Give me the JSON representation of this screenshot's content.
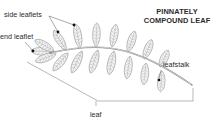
{
  "title": {
    "line1": "PINNATELY",
    "line2": "COMPOUND LEAF"
  },
  "labels": {
    "side_leaflets": "side leaflets",
    "end_leaflet": "end leaflet",
    "leafstalk": "leafstalk",
    "leaf": "leaf"
  },
  "colors": {
    "text": "#2b2b2b",
    "outline": "#8a8a8a",
    "leaflet_fill": "#f4f4f4",
    "marker": "#111111"
  }
}
